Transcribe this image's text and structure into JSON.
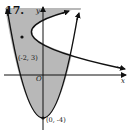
{
  "figure": {
    "problem_number": "17.",
    "axis_labels": {
      "x": "x",
      "y": "y",
      "origin": "O"
    },
    "points": [
      {
        "label": "(-2, 3)",
        "x": -2,
        "y": 3,
        "role": "vertex of sideways parabola"
      },
      {
        "label": "(0, -4)",
        "x": 0,
        "y": -4,
        "role": "vertex of upward parabola"
      }
    ],
    "curves": [
      {
        "name": "upward-parabola",
        "vertex": [
          0,
          -4
        ],
        "opens": "up"
      },
      {
        "name": "sideways-parabola",
        "vertex": [
          -2,
          3
        ],
        "opens": "right"
      }
    ],
    "shading": "region inside upward parabola and outside (left of) sideways parabola",
    "colors": {
      "shade": "#b8b8b8",
      "stroke": "#111111",
      "background": "#ffffff"
    }
  }
}
